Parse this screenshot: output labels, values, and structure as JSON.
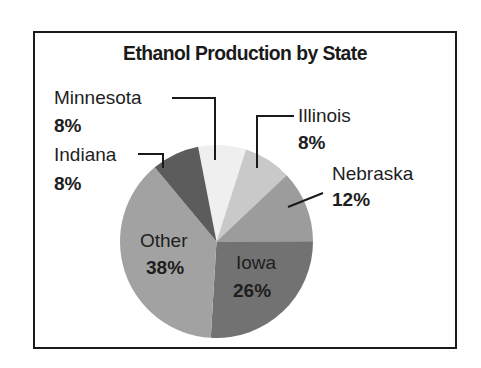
{
  "chart_data": {
    "type": "pie",
    "title": "Ethanol Production by State",
    "categories": [
      "Minnesota",
      "Illinois",
      "Nebraska",
      "Iowa",
      "Other",
      "Indiana"
    ],
    "values": [
      8,
      8,
      12,
      26,
      38,
      8
    ],
    "unit": "%",
    "labels": [
      {
        "name": "Minnesota",
        "pct": "8%"
      },
      {
        "name": "Illinois",
        "pct": "8%"
      },
      {
        "name": "Nebraska",
        "pct": "12%"
      },
      {
        "name": "Iowa",
        "pct": "26%"
      },
      {
        "name": "Other",
        "pct": "38%"
      },
      {
        "name": "Indiana",
        "pct": "8%"
      }
    ],
    "colors": [
      "#efefef",
      "#c9c9c9",
      "#9c9c9c",
      "#727272",
      "#a2a2a2",
      "#5c5c5c"
    ],
    "start_angle_deg": -11,
    "legend": "none (leader-line labels)"
  }
}
